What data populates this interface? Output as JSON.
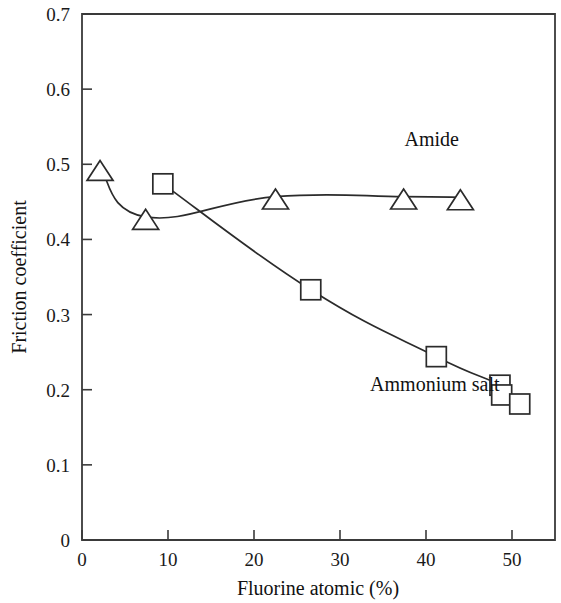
{
  "chart_data": {
    "type": "line",
    "title": "",
    "xlabel": "Fluorine atomic (%)",
    "ylabel": "Friction coefficient",
    "xlim": [
      0,
      55
    ],
    "ylim": [
      0,
      0.7
    ],
    "grid": false,
    "legend": "inline-annotations",
    "x_ticks": [
      "0",
      "10",
      "20",
      "30",
      "40",
      "50"
    ],
    "x_tick_values": [
      0,
      10,
      20,
      30,
      40,
      50
    ],
    "y_ticks": [
      "0",
      "0.1",
      "0.2",
      "0.3",
      "0.4",
      "0.5",
      "0.6",
      "0.7"
    ],
    "y_tick_values": [
      0,
      0.1,
      0.2,
      0.3,
      0.4,
      0.5,
      0.6,
      0.7
    ],
    "series": [
      {
        "name": "Amide",
        "marker": "triangle-up",
        "color": "#2b2b2b",
        "points": [
          {
            "x": 2.1,
            "y": 0.495
          },
          {
            "x": 7.4,
            "y": 0.43
          },
          {
            "x": 22.5,
            "y": 0.457
          },
          {
            "x": 37.4,
            "y": 0.457
          },
          {
            "x": 44.0,
            "y": 0.456
          }
        ]
      },
      {
        "name": "Ammonium salt",
        "marker": "square",
        "color": "#2b2b2b",
        "points": [
          {
            "x": 9.4,
            "y": 0.474
          },
          {
            "x": 26.6,
            "y": 0.333
          },
          {
            "x": 41.2,
            "y": 0.244
          },
          {
            "x": 48.6,
            "y": 0.206
          },
          {
            "x": 48.8,
            "y": 0.193
          },
          {
            "x": 50.9,
            "y": 0.181
          }
        ]
      }
    ],
    "annotations": [
      {
        "text": "Amide",
        "x": 37.5,
        "y": 0.525
      },
      {
        "text": "Ammonium salt",
        "x": 33.5,
        "y": 0.198
      }
    ]
  }
}
